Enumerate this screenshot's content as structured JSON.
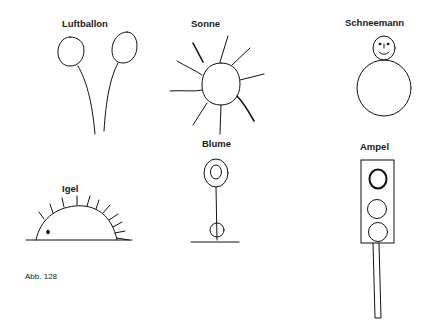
{
  "figure": {
    "caption": "Abb. 128",
    "items": [
      {
        "id": "luftballon",
        "label": "Luftballon"
      },
      {
        "id": "sonne",
        "label": "Sonne"
      },
      {
        "id": "schneemann",
        "label": "Schneemann"
      },
      {
        "id": "igel",
        "label": "Igel"
      },
      {
        "id": "blume",
        "label": "Blume"
      },
      {
        "id": "ampel",
        "label": "Ampel"
      }
    ]
  },
  "colors": {
    "ink": "#111111",
    "background": "#ffffff"
  }
}
